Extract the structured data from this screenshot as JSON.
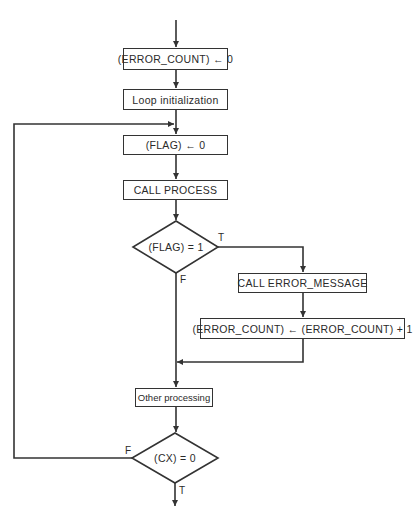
{
  "flowchart": {
    "nodes": {
      "init_error_count": "(ERROR_COUNT) ← 0",
      "loop_init": "Loop initialization",
      "reset_flag": "(FLAG) ← 0",
      "call_process": "CALL PROCESS",
      "flag_test": "(FLAG) = 1",
      "call_error_message": "CALL ERROR_MESSAGE",
      "increment_error_count": "(ERROR_COUNT) ← (ERROR_COUNT) + 1",
      "other_processing": "Other processing",
      "cx_test": "(CX) = 0"
    },
    "labels": {
      "flag_true": "T",
      "flag_false": "F",
      "cx_false": "F",
      "cx_true": "T"
    },
    "colors": {
      "line": "#333333",
      "background": "#ffffff"
    }
  }
}
